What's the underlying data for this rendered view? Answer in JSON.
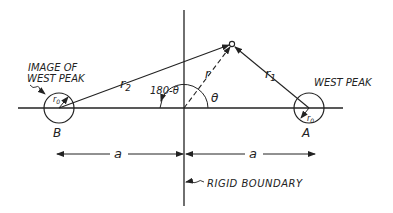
{
  "diagram": {
    "labels": {
      "image_of": "IMAGE OF",
      "west_peak_image": "WEST PEAK",
      "west_peak": "WEST PEAK",
      "r2": "r",
      "r2_sub": "2",
      "r1": "r",
      "r1_sub": "1",
      "r": "r",
      "angle_supp": "180-θ",
      "theta": "θ",
      "r0_left": "r",
      "r0_left_sub": "0",
      "r0_right": "r",
      "r0_right_sub": "0",
      "point_b": "B",
      "point_a": "A",
      "dist_left": "a",
      "dist_right": "a",
      "rigid_boundary": "RIGID BOUNDARY"
    },
    "colors": {
      "stroke": "#222222",
      "background": "#ffffff"
    }
  }
}
